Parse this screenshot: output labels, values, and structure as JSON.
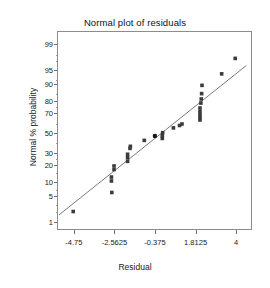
{
  "chart_data": {
    "type": "scatter",
    "title": "Normal plot of residuals",
    "xlabel": "Residual",
    "ylabel": "Normal % probability",
    "grid": false,
    "legend": null,
    "xlim": [
      -5.6,
      4.8
    ],
    "ylim_percent": [
      0.6,
      99.6
    ],
    "x_ticks": [
      -4.75,
      -2.5625,
      -0.375,
      1.8125,
      4
    ],
    "x_tick_labels": [
      "-4.75",
      "-2.5625",
      "-0.375",
      "1.8125",
      "4"
    ],
    "y_ticks": [
      1,
      5,
      10,
      20,
      30,
      50,
      70,
      80,
      90,
      95,
      99
    ],
    "y_tick_labels": [
      "1",
      "5",
      "10",
      "20",
      "30",
      "50",
      "70",
      "80",
      "90",
      "95",
      "99"
    ],
    "y_minor_ticks": [
      2,
      3,
      7,
      15,
      25,
      40,
      60,
      75,
      85,
      92,
      97,
      98
    ],
    "marker_color": "#3b3b3b",
    "line_color": "#6b6b6b",
    "frame_color": "#8c8c8c",
    "series": [
      {
        "name": "Residual points",
        "marker": "square",
        "points": [
          {
            "x": -4.78,
            "p": 2.0
          },
          {
            "x": -2.72,
            "p": 10.5
          },
          {
            "x": -2.72,
            "p": 12.5
          },
          {
            "x": -2.7,
            "p": 6.0
          },
          {
            "x": -2.58,
            "p": 17.0
          },
          {
            "x": -2.58,
            "p": 19.5
          },
          {
            "x": -1.85,
            "p": 23.0
          },
          {
            "x": -1.85,
            "p": 26.0
          },
          {
            "x": -1.85,
            "p": 29.0
          },
          {
            "x": -1.72,
            "p": 34.5
          },
          {
            "x": -1.7,
            "p": 36.5
          },
          {
            "x": -0.95,
            "p": 42.5
          },
          {
            "x": -0.38,
            "p": 47.0
          },
          {
            "x": 0.02,
            "p": 44.5
          },
          {
            "x": 0.02,
            "p": 47.5
          },
          {
            "x": 0.04,
            "p": 50.5
          },
          {
            "x": 0.62,
            "p": 55.5
          },
          {
            "x": 0.95,
            "p": 58.0
          },
          {
            "x": 1.08,
            "p": 59.5
          },
          {
            "x": 2.05,
            "p": 63.5
          },
          {
            "x": 2.05,
            "p": 66.0
          },
          {
            "x": 2.05,
            "p": 68.5
          },
          {
            "x": 2.05,
            "p": 71.5
          },
          {
            "x": 2.05,
            "p": 74.5
          },
          {
            "x": 2.1,
            "p": 78.5
          },
          {
            "x": 2.12,
            "p": 81.5
          },
          {
            "x": 2.14,
            "p": 85.0
          },
          {
            "x": 2.16,
            "p": 89.5
          },
          {
            "x": 3.22,
            "p": 94.0
          },
          {
            "x": 3.95,
            "p": 97.5
          }
        ]
      }
    ],
    "fit_line": {
      "name": "Normal reference line",
      "x_start": -5.55,
      "p_start": 1.6,
      "x_end": 4.55,
      "p_end": 96.2
    },
    "highlight_point": {
      "x": -0.38,
      "p": 47.0,
      "marker": "circle",
      "color": "#1a1a1a"
    }
  }
}
